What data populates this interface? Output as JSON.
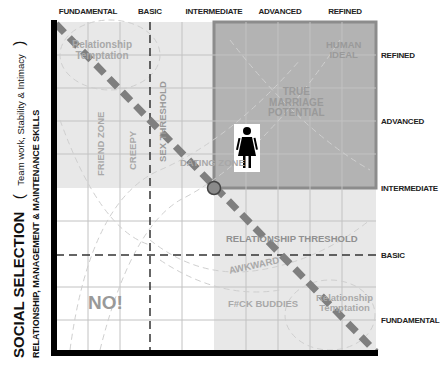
{
  "x_axis": {
    "ticks": [
      "FUNDAMENTAL",
      "BASIC",
      "INTERMEDIATE",
      "ADVANCED",
      "REFINED"
    ]
  },
  "y_axis": {
    "title": "SOCIAL SELECTION",
    "paren_open": "(",
    "subtitle": "Team work, Stability & Intimacy",
    "paren_close": ")",
    "title_line2": "RELATIONSHIP, MANAGEMENT & MAINTENANCE SKILLS",
    "ticks": [
      "REFINED",
      "ADVANCED",
      "INTERMEDIATE",
      "BASIC",
      "FUNDAMENTAL"
    ]
  },
  "zones": {
    "relationship_temptation_top_line1": "Relationship",
    "relationship_temptation_top_line2": "Temptation",
    "human_ideal_line1": "HUMAN",
    "human_ideal_line2": "IDEAL",
    "true_marriage_line1": "TRUE",
    "true_marriage_line2": "MARRIAGE",
    "true_marriage_line3": "POTENTIAL",
    "friend_zone": "FRIEND ZONE",
    "creepy": "CREEPY",
    "sex_threshold": "SEX THRESHOLD",
    "dating_zone": "DATING ZONE",
    "relationship_threshold": "RELATIONSHIP THRESHOLD",
    "awkward": "AWKWARD",
    "fck_buddies": "F#CK BUDDIES",
    "no": "NO!",
    "relationship_temptation_bottom_line1": "Relationship",
    "relationship_temptation_bottom_line2": "Temptation"
  },
  "icons": {
    "woman": "woman-figure-icon"
  },
  "colors": {
    "plot_light": "#e6e6e6",
    "plot_white": "#ffffff",
    "true_marriage_box": "#b4b4b4",
    "diagonal": "#7f7f7f",
    "circle_fill": "#8a8a8a",
    "axis": "#000000",
    "grid": "#c4c4c4"
  }
}
